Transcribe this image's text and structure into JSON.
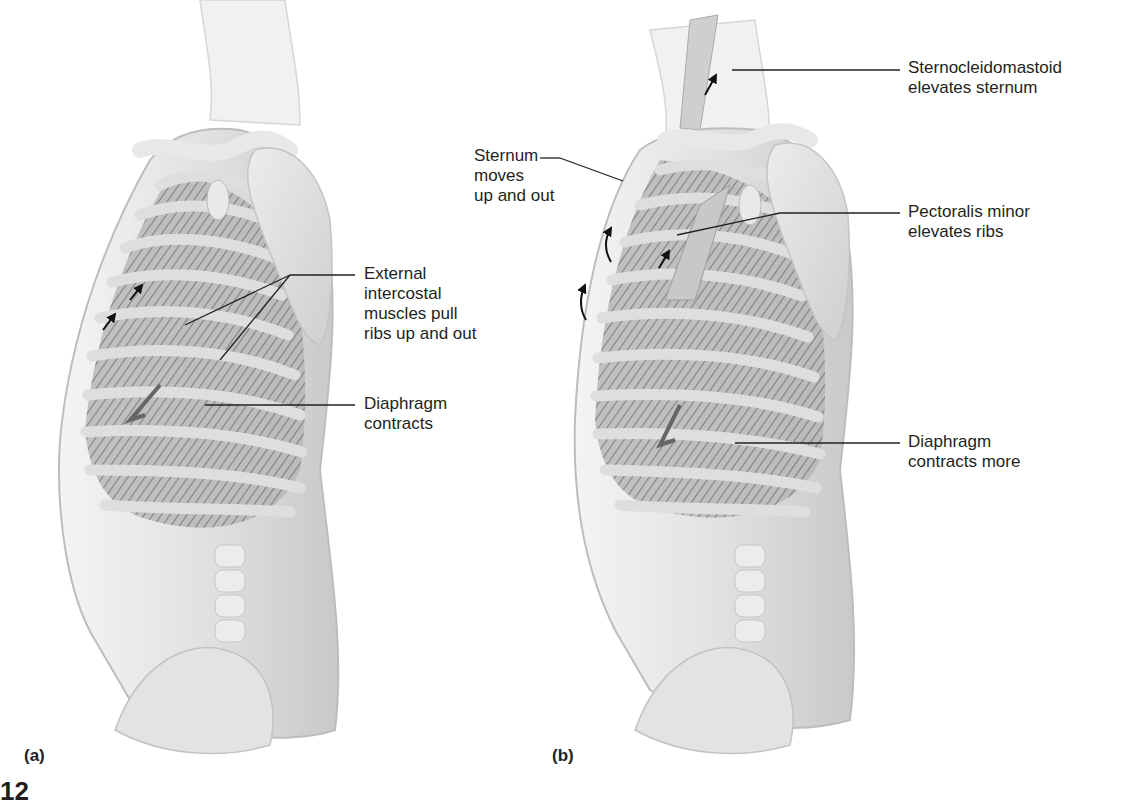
{
  "figure": {
    "partial_figure_number": "12",
    "colors": {
      "background": "#ffffff",
      "body_fill": "#e6e6e6",
      "body_shade": "#bdbdbd",
      "rib": "#d4d4d4",
      "intercostal": "#8a8a8a",
      "line": "#231f20",
      "text": "#231f20"
    },
    "panels": [
      {
        "id": "a",
        "label": "(a)",
        "annotations": [
          {
            "id": "external-intercostal",
            "text": "External\nintercostal\nmuscles pull\nribs up and out"
          },
          {
            "id": "diaphragm-a",
            "text": "Diaphragm\ncontracts"
          }
        ],
        "arrows": [
          "up-arrow",
          "up-arrow",
          "diaphragm-down-arrow"
        ]
      },
      {
        "id": "b",
        "label": "(b)",
        "annotations": [
          {
            "id": "sternocleidomastoid",
            "text": "Sternocleidomastoid\nelevates sternum"
          },
          {
            "id": "sternum",
            "text": "Sternum\nmoves\nup and out"
          },
          {
            "id": "pectoralis-minor",
            "text": "Pectoralis minor\nelevates ribs"
          },
          {
            "id": "diaphragm-b",
            "text": "Diaphragm\ncontracts more"
          }
        ],
        "arrows": [
          "up-arrow",
          "up-arrow",
          "curved-up-arrow",
          "curved-up-arrow",
          "diaphragm-down-arrow"
        ]
      }
    ]
  }
}
